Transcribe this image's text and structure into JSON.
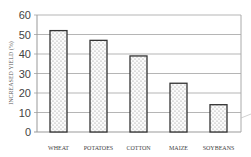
{
  "chart_data": {
    "type": "bar",
    "title": "",
    "xlabel": "",
    "ylabel": "INCREASED YIELD (%)",
    "categories": [
      "WHEAT",
      "POTATOES",
      "COTTON",
      "MAIZE",
      "SOYBEANS"
    ],
    "values": [
      52,
      47,
      39,
      25,
      14
    ],
    "ylim": [
      0,
      60
    ],
    "yticks": [
      0,
      10,
      20,
      30,
      40,
      50,
      60
    ],
    "grid": true,
    "legend": null,
    "bar_fill": "dotted pattern",
    "colors": {
      "bar_border": "#333333",
      "bar_dots": "#8a8a8a",
      "grid": "#b5b5b5",
      "text": "#444444"
    }
  }
}
